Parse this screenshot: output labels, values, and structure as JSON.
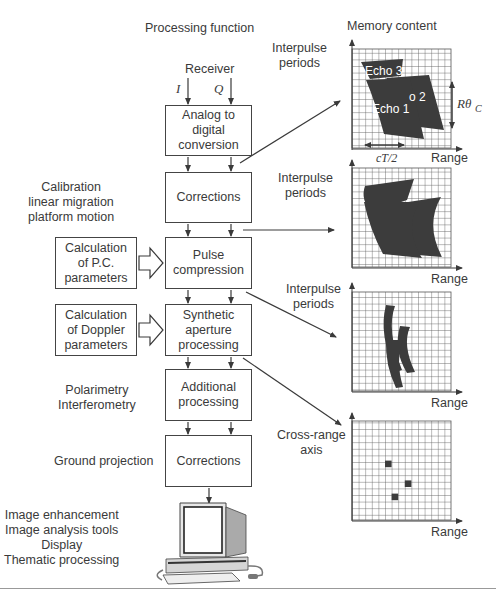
{
  "headers": {
    "processing_function": "Processing function",
    "memory_content": "Memory content"
  },
  "receiver": {
    "label": "Receiver",
    "i_label": "I",
    "q_label": "Q"
  },
  "pipeline": [
    {
      "id": "adc",
      "label": "Analog to\ndigital\nconversion"
    },
    {
      "id": "corrections1",
      "label": "Corrections"
    },
    {
      "id": "pulse_compression",
      "label": "Pulse\ncompression"
    },
    {
      "id": "synthetic_aperture",
      "label": "Synthetic\naperture\nprocessing"
    },
    {
      "id": "additional",
      "label": "Additional\nprocessing"
    },
    {
      "id": "corrections2",
      "label": "Corrections"
    }
  ],
  "side_inputs": [
    {
      "id": "pc_params",
      "label": "Calculation\nof P.C.\nparameters"
    },
    {
      "id": "doppler_params",
      "label": "Calculation\nof Doppler\nparameters"
    }
  ],
  "side_notes": {
    "calibration": "Calibration\nlinear migration\nplatform motion",
    "polarimetry": "Polarimetry\nInterferometry",
    "ground_projection": "Ground projection",
    "display_tasks": "Image enhancement\nImage analysis tools\nDisplay\nThematic processing"
  },
  "memory_panels": [
    {
      "y_label": "Interpulse\nperiods",
      "x_label": "Range",
      "annotations": {
        "echo3": "Echo 3",
        "echo2": "o 2",
        "echo1": "Echo 1",
        "r_theta": "Rθ",
        "r_theta_sub": "C",
        "ct2": "cT/2"
      }
    },
    {
      "y_label": "Interpulse\nperiods",
      "x_label": "Range"
    },
    {
      "y_label": "Interpulse\nperiods",
      "x_label": "Range"
    },
    {
      "y_label": "Cross-range\naxis",
      "x_label": "Range",
      "point_targets": [
        {
          "col": 5,
          "row": 6
        },
        {
          "col": 8,
          "row": 9
        },
        {
          "col": 6,
          "row": 11
        }
      ]
    }
  ],
  "grid": {
    "columns": 15,
    "rows": 15
  },
  "colors": {
    "ink": "#3a3a3a",
    "fill_dark": "#3c3c3c",
    "grid_line": "#555555"
  }
}
